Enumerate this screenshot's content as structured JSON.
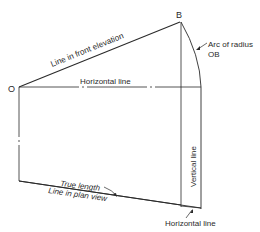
{
  "diagram": {
    "points": {
      "O": {
        "label": "O",
        "x": 18,
        "y": 87
      },
      "B": {
        "label": "B",
        "x": 180,
        "y": 22
      }
    },
    "labels": {
      "front_elevation": "Line in front elevation",
      "horizontal_top": "Horizontal line",
      "arc_line1": "Arc of radius",
      "arc_line2": "OB",
      "vertical": "Vertical line",
      "true_length": "True length",
      "plan_view": "Line in plan view",
      "horizontal_bottom": "Horizontal line"
    },
    "colors": {
      "line": "#2a2a2a",
      "background": "#ffffff"
    }
  }
}
